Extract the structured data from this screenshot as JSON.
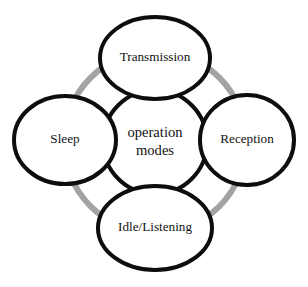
{
  "diagram": {
    "center": {
      "name": "center-node",
      "label_line1": "operation",
      "label_line2": "modes",
      "label_full": "operation modes",
      "cx": 155,
      "cy": 142,
      "rx": 52,
      "ry": 52
    },
    "ring": {
      "name": "cycle-ring",
      "color": "#a3a3a3",
      "stroke_width": 6,
      "cx": 155,
      "cy": 142,
      "r": 91
    },
    "outline_color": "#0d0d0d",
    "outline_width": 4,
    "fill_color": "#ffffff",
    "nodes": [
      {
        "id": "transmission",
        "label": "Transmission",
        "position": "top",
        "cx": 155,
        "cy": 58,
        "rx": 55,
        "ry": 41
      },
      {
        "id": "reception",
        "label": "Reception",
        "position": "right",
        "cx": 247,
        "cy": 140,
        "rx": 47,
        "ry": 45
      },
      {
        "id": "idle-listening",
        "label": "Idle/Listening",
        "position": "bottom",
        "cx": 155,
        "cy": 228,
        "rx": 57,
        "ry": 42
      },
      {
        "id": "sleep",
        "label": "Sleep",
        "position": "left",
        "cx": 65,
        "cy": 140,
        "rx": 51,
        "ry": 44
      }
    ]
  }
}
